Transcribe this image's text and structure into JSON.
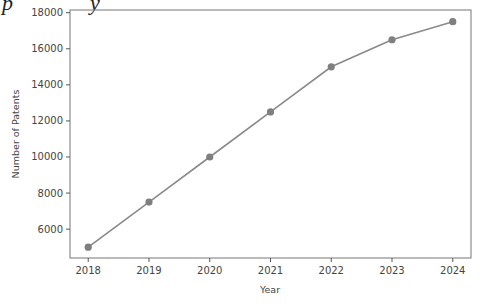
{
  "cropped_caption": "p          y",
  "chart_data": {
    "type": "line",
    "title": "",
    "xlabel": "Year",
    "ylabel": "Number of Patents",
    "categories": [
      "2018",
      "2019",
      "2020",
      "2021",
      "2022",
      "2023",
      "2024"
    ],
    "x": [
      2018,
      2019,
      2020,
      2021,
      2022,
      2023,
      2024
    ],
    "values": [
      5000,
      7500,
      10000,
      12500,
      15000,
      16500,
      17500
    ],
    "series": [
      {
        "name": "Number of Patents",
        "values": [
          5000,
          7500,
          10000,
          12500,
          15000,
          16500,
          17500
        ],
        "color": "#8a8a8a",
        "marker": "circle"
      }
    ],
    "yticks": [
      6000,
      8000,
      10000,
      12000,
      14000,
      16000,
      18000
    ],
    "ytick_labels": [
      "6000",
      "8000",
      "10000",
      "12000",
      "14000",
      "16000",
      "18000"
    ],
    "xtick_labels": [
      "2018",
      "2019",
      "2020",
      "2021",
      "2022",
      "2023",
      "2024"
    ],
    "ylim": [
      4400,
      18150
    ],
    "xlim": [
      2017.7,
      2024.3
    ],
    "grid": false,
    "legend": null
  }
}
